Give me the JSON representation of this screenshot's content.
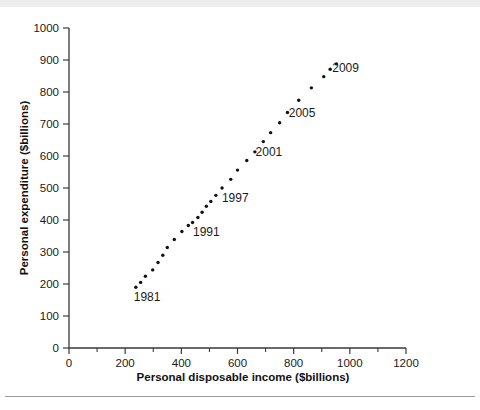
{
  "figure": {
    "background_color": "#ffffff",
    "ink_color": "#111111"
  },
  "chart_data": {
    "type": "scatter",
    "title": "",
    "xlabel": "Personal disposable income ($billions)",
    "ylabel": "Personal expenditure ($billions)",
    "xlim": [
      0,
      1200
    ],
    "ylim": [
      0,
      1000
    ],
    "xticks": [
      0,
      200,
      400,
      600,
      800,
      1000,
      1200
    ],
    "xticklabels": [
      "0",
      "200",
      "400",
      "600",
      "800",
      "1000",
      "1200"
    ],
    "xminor_step": 100,
    "yticks": [
      0,
      100,
      200,
      300,
      400,
      500,
      600,
      700,
      800,
      900,
      1000
    ],
    "yticklabels": [
      "0",
      "100",
      "200",
      "300",
      "400",
      "500",
      "600",
      "700",
      "800",
      "900",
      "1000"
    ],
    "grid": false,
    "legend": null,
    "marker": "dot",
    "series_name": "Personal expenditure vs disposable income",
    "points": [
      {
        "year": 1981,
        "x": 238,
        "y": 190
      },
      {
        "year": 1982,
        "x": 255,
        "y": 205
      },
      {
        "year": 1983,
        "x": 272,
        "y": 224
      },
      {
        "year": 1984,
        "x": 298,
        "y": 244
      },
      {
        "year": 1985,
        "x": 317,
        "y": 267
      },
      {
        "year": 1986,
        "x": 334,
        "y": 290
      },
      {
        "year": 1987,
        "x": 350,
        "y": 314
      },
      {
        "year": 1988,
        "x": 375,
        "y": 339
      },
      {
        "year": 1989,
        "x": 402,
        "y": 364
      },
      {
        "year": 1990,
        "x": 425,
        "y": 383
      },
      {
        "year": 1991,
        "x": 440,
        "y": 392
      },
      {
        "year": 1992,
        "x": 459,
        "y": 408
      },
      {
        "year": 1993,
        "x": 474,
        "y": 424
      },
      {
        "year": 1994,
        "x": 489,
        "y": 443
      },
      {
        "year": 1995,
        "x": 505,
        "y": 458
      },
      {
        "year": 1996,
        "x": 523,
        "y": 477
      },
      {
        "year": 1997,
        "x": 545,
        "y": 500
      },
      {
        "year": 1998,
        "x": 576,
        "y": 527
      },
      {
        "year": 1999,
        "x": 600,
        "y": 556
      },
      {
        "year": 2000,
        "x": 633,
        "y": 586
      },
      {
        "year": 2001,
        "x": 662,
        "y": 613
      },
      {
        "year": 2002,
        "x": 692,
        "y": 645
      },
      {
        "year": 2003,
        "x": 718,
        "y": 673
      },
      {
        "year": 2004,
        "x": 750,
        "y": 704
      },
      {
        "year": 2005,
        "x": 778,
        "y": 736
      },
      {
        "year": 2006,
        "x": 818,
        "y": 774
      },
      {
        "year": 2007,
        "x": 863,
        "y": 813
      },
      {
        "year": 2008,
        "x": 907,
        "y": 848
      },
      {
        "year": 2009,
        "x": 930,
        "y": 871
      },
      {
        "year": 2010,
        "x": 952,
        "y": 888
      }
    ],
    "annotations": [
      {
        "text": "1981",
        "x": 278,
        "y": 160
      },
      {
        "text": "1991",
        "x": 489,
        "y": 362
      },
      {
        "text": "1997",
        "x": 592,
        "y": 470
      },
      {
        "text": "2001",
        "x": 712,
        "y": 614
      },
      {
        "text": "2005",
        "x": 830,
        "y": 733
      },
      {
        "text": "2009",
        "x": 985,
        "y": 875
      }
    ]
  }
}
